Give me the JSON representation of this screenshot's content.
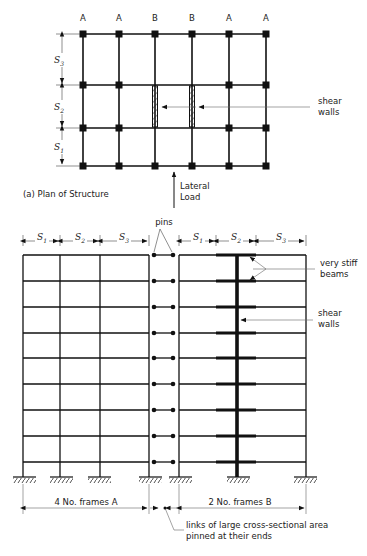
{
  "plan": {
    "caption": "(a) Plan of Structure",
    "column_labels": [
      "A",
      "A",
      "B",
      "B",
      "A",
      "A"
    ],
    "bay_labels": [
      {
        "base": "S",
        "sub": "3"
      },
      {
        "base": "S",
        "sub": "2"
      },
      {
        "base": "S",
        "sub": "1"
      }
    ],
    "shear_walls_label_line1": "shear",
    "shear_walls_label_line2": "walls",
    "lateral_load_line1": "Lateral",
    "lateral_load_line2": "Load"
  },
  "elevation": {
    "pins_label": "pins",
    "left_dims": [
      {
        "base": "S",
        "sub": "1"
      },
      {
        "base": "S",
        "sub": "2"
      },
      {
        "base": "S",
        "sub": "3"
      }
    ],
    "right_dims": [
      {
        "base": "S",
        "sub": "1"
      },
      {
        "base": "S",
        "sub": "2"
      },
      {
        "base": "S",
        "sub": "3"
      }
    ],
    "stiff_beams_line1": "very stiff",
    "stiff_beams_line2": "beams",
    "shear_walls_line1": "shear",
    "shear_walls_line2": "walls",
    "frames_a_label": "4 No. frames A",
    "frames_b_label": "2 No. frames B",
    "links_line1": "links of large cross-sectional area",
    "links_line2": "pinned at their ends",
    "floor_count": 9
  }
}
